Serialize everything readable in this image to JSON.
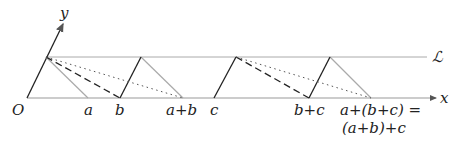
{
  "diagram": {
    "axis_labels": {
      "x": "x",
      "y": "y",
      "origin": "O",
      "line": "ℒ"
    },
    "point_labels": {
      "a": "a",
      "b": "b",
      "a_plus_b": "a+b",
      "c": "c",
      "b_plus_c": "b+c",
      "result_line1": "a+(b+c) =",
      "result_line2": "(a+b)+c"
    },
    "colors": {
      "axis": "#888888",
      "dark": "#222222",
      "light": "#aaaaaa"
    }
  }
}
